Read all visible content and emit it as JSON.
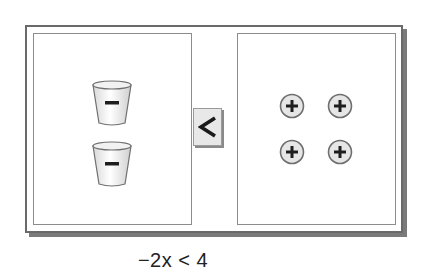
{
  "diagram": {
    "left_side": {
      "items": [
        {
          "type": "cup",
          "sign": "−",
          "label": "negative x cup"
        },
        {
          "type": "cup",
          "sign": "−",
          "label": "negative x cup"
        }
      ],
      "count": 2
    },
    "comparison": {
      "symbol": "<",
      "icon": "less-than-icon"
    },
    "right_side": {
      "items": [
        {
          "type": "counter",
          "sign": "+",
          "label": "positive unit counter"
        },
        {
          "type": "counter",
          "sign": "+",
          "label": "positive unit counter"
        },
        {
          "type": "counter",
          "sign": "+",
          "label": "positive unit counter"
        },
        {
          "type": "counter",
          "sign": "+",
          "label": "positive unit counter"
        }
      ],
      "count": 4
    },
    "equation": "−2x < 4"
  },
  "colors": {
    "frame_border": "#6a6a6a",
    "panel_border": "#8c8c8c",
    "symbol_bg": "#e8e8e8",
    "counter_fill": "#e6e6e6",
    "text": "#222222"
  }
}
